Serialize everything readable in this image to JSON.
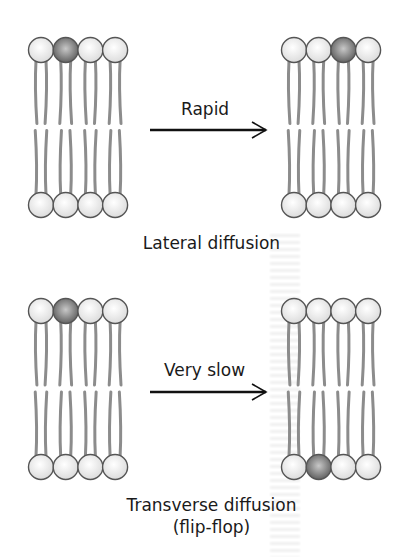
{
  "figure": {
    "panels": [
      {
        "id": "lateral",
        "arrow_label": "Rapid",
        "caption_lines": [
          "Lateral diffusion"
        ],
        "before": {
          "highlight_layer": "top",
          "highlight_index": 1
        },
        "after": {
          "highlight_layer": "top",
          "highlight_index": 2
        }
      },
      {
        "id": "transverse",
        "arrow_label": "Very slow",
        "caption_lines": [
          "Transverse diffusion",
          "(flip-flop)"
        ],
        "before": {
          "highlight_layer": "top",
          "highlight_index": 1
        },
        "after": {
          "highlight_layer": "bottom",
          "highlight_index": 1
        }
      }
    ],
    "colors": {
      "head_fill": "#ececec",
      "head_stroke": "#555555",
      "highlight_head": "#8a8a8a",
      "tail": "#8c8c8c",
      "arrow": "#111111"
    },
    "lipids_per_leaflet": 4
  }
}
